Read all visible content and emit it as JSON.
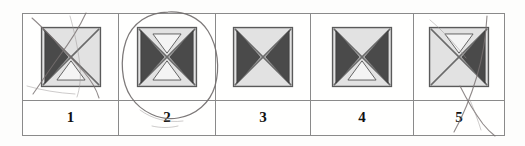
{
  "document": {
    "kind": "printed-answer-strip",
    "background_color": "#fdfdfc",
    "table_border_color": "#8a8a8a"
  },
  "answer_strip": {
    "options": [
      {
        "number": "1",
        "symbol_name": "square-with-x-left-dark-bottom-white",
        "triangles": {
          "left": "dark",
          "right": "none",
          "top": "none",
          "bottom": "white"
        },
        "marking": "crossed-out",
        "selected": false
      },
      {
        "number": "2",
        "symbol_name": "square-with-x-left-right-dark-top-bottom-white",
        "triangles": {
          "left": "dark",
          "right": "dark",
          "top": "white",
          "bottom": "white"
        },
        "marking": "circled",
        "selected": true
      },
      {
        "number": "3",
        "symbol_name": "square-with-x-left-right-dark",
        "triangles": {
          "left": "dark",
          "right": "dark",
          "top": "none",
          "bottom": "none"
        },
        "marking": "none",
        "selected": false
      },
      {
        "number": "4",
        "symbol_name": "square-with-x-left-right-dark-bottom-white",
        "triangles": {
          "left": "dark",
          "right": "dark",
          "top": "none",
          "bottom": "white"
        },
        "marking": "none",
        "selected": false
      },
      {
        "number": "5",
        "symbol_name": "square-with-x-right-dark-top-white",
        "triangles": {
          "left": "none",
          "right": "dark",
          "top": "white",
          "bottom": "none"
        },
        "marking": "scribbled",
        "selected": false
      }
    ]
  },
  "colors": {
    "dark_triangle": "#4a4a4a",
    "light_triangle": "#f4f4f4",
    "square_fill": "#e2e2e2",
    "square_stroke": "#5a5a5a",
    "pen_ink": "#777070"
  }
}
